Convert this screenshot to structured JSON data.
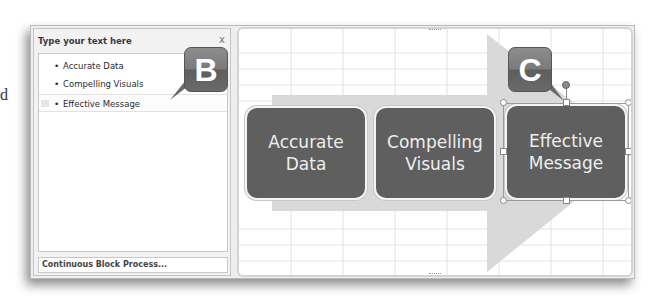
{
  "edge_glyph": "d",
  "text_pane": {
    "title": "Type your text here",
    "close_label": "x",
    "items": [
      {
        "label": "Accurate Data"
      },
      {
        "label": "Compelling Visuals"
      },
      {
        "label": "Effective Message"
      }
    ],
    "footer": "Continuous Block Process..."
  },
  "callouts": {
    "b": "B",
    "c": "C"
  },
  "diagram": {
    "layout": "Continuous Block Process",
    "blocks": [
      {
        "line1": "Accurate",
        "line2": "Data"
      },
      {
        "line1": "Compelling",
        "line2": "Visuals"
      },
      {
        "line1": "Effective",
        "line2": "Message"
      }
    ],
    "colors": {
      "block_fill": "#5f5f5f",
      "arrow_fill": "#d9d9d9",
      "callout_fill": "#7a7a7a"
    }
  }
}
